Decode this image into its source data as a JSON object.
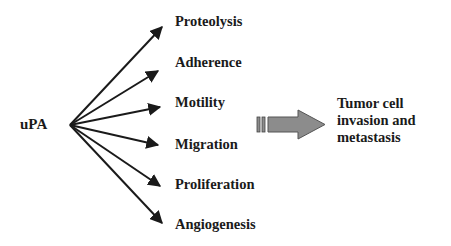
{
  "diagram": {
    "source": {
      "label": "uPA"
    },
    "effects": [
      {
        "label": "Proteolysis"
      },
      {
        "label": "Adherence"
      },
      {
        "label": "Motility"
      },
      {
        "label": "Migration"
      },
      {
        "label": "Proliferation"
      },
      {
        "label": "Angiogenesis"
      }
    ],
    "outcome": {
      "lines": [
        "Tumor cell",
        "invasion and",
        "metastasis"
      ]
    },
    "colors": {
      "text": "#1a1a1a",
      "arrow": "#1a1a1a",
      "block_arrow_fill": "#8c8c8c",
      "block_arrow_stroke": "#555555"
    }
  }
}
